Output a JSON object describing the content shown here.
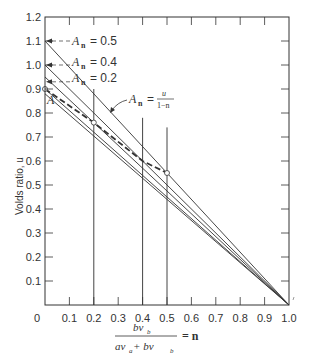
{
  "chart_data": {
    "type": "line",
    "title": "",
    "xlabel_numerator": "bv_b",
    "xlabel_denominator": "av_a + bv_b",
    "xlabel_suffix": "= n",
    "ylabel": "Volds ratio, u",
    "xlim": [
      0,
      1.0
    ],
    "ylim": [
      0,
      1.2
    ],
    "x_ticks": [
      "0",
      "0.1",
      "0.2",
      "0.3",
      "0.4",
      "0.5",
      "0.6",
      "0.7",
      "0.8",
      "0.9",
      "1.0"
    ],
    "y_ticks": [
      "0.1",
      "0.2",
      "0.3",
      "0.4",
      "0.5",
      "0.6",
      "0.7",
      "0.8",
      "0.9",
      "1.0",
      "1.1",
      "1.2"
    ],
    "series": [
      {
        "name": "A_n = 0.5",
        "style": "solid",
        "points": [
          [
            0,
            1.1
          ],
          [
            1.0,
            0
          ]
        ]
      },
      {
        "name": "A_n = 0.4",
        "style": "solid",
        "points": [
          [
            0,
            1.0
          ],
          [
            1.0,
            0
          ]
        ]
      },
      {
        "name": "A_n = 0.2",
        "style": "solid",
        "points": [
          [
            0,
            0.95
          ],
          [
            1.0,
            0
          ]
        ]
      },
      {
        "name": "A (n=0)",
        "style": "solid",
        "points": [
          [
            0,
            0.9
          ],
          [
            1.0,
            0
          ]
        ]
      },
      {
        "name": "lower line",
        "style": "solid",
        "points": [
          [
            0,
            0.88
          ],
          [
            1.0,
            0
          ]
        ]
      },
      {
        "name": "A_n = u/(1-n)",
        "style": "dashed",
        "points": [
          [
            0,
            0.9
          ],
          [
            0.2,
            0.76
          ],
          [
            0.4,
            0.6
          ],
          [
            0.5,
            0.55
          ]
        ]
      }
    ],
    "vertical_lines": [
      {
        "x": 0.2,
        "top": 0.9
      },
      {
        "x": 0.4,
        "top": 0.78
      },
      {
        "x": 0.5,
        "top": 0.74
      }
    ],
    "annotations": [
      {
        "text": "A",
        "sub": "n",
        "value": "= 0.5",
        "y": 1.1
      },
      {
        "text": "A",
        "sub": "n",
        "value": "= 0.4",
        "y": 1.0
      },
      {
        "text": "A",
        "sub": "n",
        "value": "= 0.2",
        "y": 0.93
      },
      {
        "text": "A",
        "label": "point A",
        "y": 0.9
      },
      {
        "text": "A",
        "sub": "n",
        "value": "= u/(1-n)",
        "label": "curve label"
      }
    ],
    "grid": false
  },
  "labels": {
    "ann_05": "= 0.5",
    "ann_04": "= 0.4",
    "ann_02": "= 0.2",
    "A": "A",
    "sub_n": "n",
    "curve_eq": "=",
    "curve_num": "u",
    "curve_den": "1−n",
    "ylabel": "Volds ratio, u",
    "x_num": "bv",
    "x_num_sub": "b",
    "x_den_a": "av",
    "x_den_a_sub": "a",
    "x_den_plus": " + bv",
    "x_den_b_sub": "b",
    "x_eq": "= n",
    "origin": "0"
  }
}
